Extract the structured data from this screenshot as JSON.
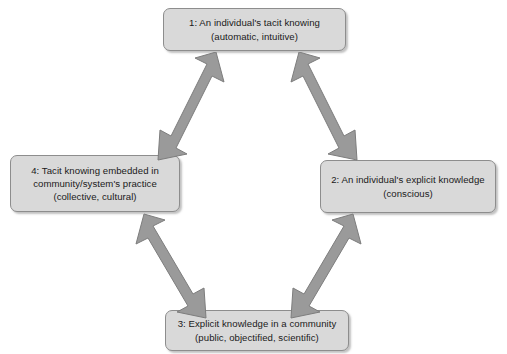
{
  "diagram": {
    "colors": {
      "node_fill": "#d9d9d9",
      "node_border": "#8d8d8d",
      "arrow_fill": "#9a9a9a",
      "arrow_stroke": "#7d7d7d",
      "background": "#ffffff",
      "text": "#1a1a1a"
    },
    "nodes": [
      {
        "id": "node-top",
        "position": "top",
        "line1": "1: An individual's tacit knowing",
        "line2": "(automatic, intuitive)",
        "line3": ""
      },
      {
        "id": "node-right",
        "position": "right",
        "line1": "2: An individual's explicit knowledge",
        "line2": "(conscious)",
        "line3": ""
      },
      {
        "id": "node-bottom",
        "position": "bottom",
        "line1": "3: Explicit knowledge in a community",
        "line2": "(public, objectified, scientific)",
        "line3": ""
      },
      {
        "id": "node-left",
        "position": "left",
        "line1": "4: Tacit knowing embedded in",
        "line2": "community/system's practice",
        "line3": "(collective, cultural)"
      }
    ],
    "arrows": [
      {
        "id": "arrow-tl",
        "name": "double-arrow-top-left",
        "from": "node-left",
        "to": "node-top",
        "style": "double-headed"
      },
      {
        "id": "arrow-tr",
        "name": "double-arrow-top-right",
        "from": "node-top",
        "to": "node-right",
        "style": "double-headed"
      },
      {
        "id": "arrow-bl",
        "name": "double-arrow-bottom-left",
        "from": "node-left",
        "to": "node-bottom",
        "style": "double-headed"
      },
      {
        "id": "arrow-br",
        "name": "double-arrow-bottom-right",
        "from": "node-bottom",
        "to": "node-right",
        "style": "double-headed"
      }
    ]
  }
}
